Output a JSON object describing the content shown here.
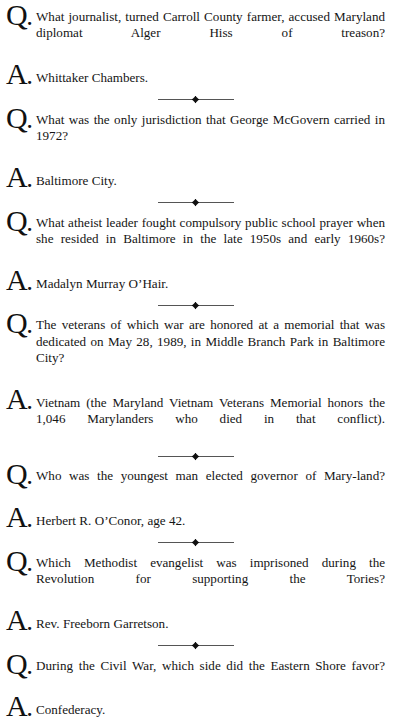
{
  "page": {
    "background_color": "#ffffff",
    "text_color": "#141414",
    "rule_color": "#555555"
  },
  "ornament": {
    "name": "diamond-divider",
    "glyph": "♦"
  },
  "qa_items": [
    {
      "q_marker": "Q",
      "a_marker": "A",
      "question": "What journalist, turned Carroll County farmer, accused Maryland diplomat Alger Hiss of treason?",
      "answer": "Whittaker Chambers."
    },
    {
      "q_marker": "Q",
      "a_marker": "A",
      "question": "What was the only jurisdiction that George McGovern carried in 1972?",
      "answer": "Baltimore City."
    },
    {
      "q_marker": "Q",
      "a_marker": "A",
      "question": "What atheist leader fought compulsory public school prayer when she resided in Baltimore in the late 1950s and early 1960s?",
      "answer": "Madalyn Murray O’Hair."
    },
    {
      "q_marker": "Q",
      "a_marker": "A",
      "question": "The veterans of which war are honored at a memorial that was dedicated on May 28, 1989, in Middle Branch Park in Baltimore City?",
      "answer": "Vietnam (the Maryland Vietnam Veterans Memorial honors the 1,046 Marylanders who died in that conflict)."
    },
    {
      "q_marker": "Q",
      "a_marker": "A",
      "question": "Who was the youngest man elected governor of Mary-land?",
      "answer": "Herbert R. O’Conor, age 42."
    },
    {
      "q_marker": "Q",
      "a_marker": "A",
      "question": "Which Methodist evangelist was imprisoned during the Revolution for supporting the Tories?",
      "answer": "Rev. Freeborn Garretson."
    },
    {
      "q_marker": "Q",
      "a_marker": "A",
      "question": "During the Civil War, which side did the Eastern Shore favor?",
      "answer": "Confederacy."
    }
  ]
}
